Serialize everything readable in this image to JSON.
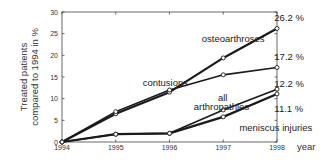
{
  "chart_data": {
    "type": "line",
    "title": "",
    "xlabel": "year",
    "ylabel": "Treated patients compared to 1994 in %",
    "ylabel_lines": [
      "Treated patients",
      "compared to 1994 in %"
    ],
    "x": [
      1994,
      1995,
      1996,
      1997,
      1998
    ],
    "xticks": [
      "1994",
      "1995",
      "1996",
      "1997",
      "1998"
    ],
    "yticks": [
      "0",
      "5",
      "10",
      "15",
      "20",
      "25",
      "30"
    ],
    "ylim": [
      0,
      30
    ],
    "grid": false,
    "legend": "inline labels",
    "series": [
      {
        "name": "osteoarthroses",
        "values": [
          0,
          6.5,
          11.5,
          19.4,
          26.2
        ],
        "end_label": "26.2 %",
        "stroke_width": 2.2
      },
      {
        "name": "contusions",
        "values": [
          0,
          7.0,
          12.0,
          15.5,
          17.2
        ],
        "end_label": "17.2 %",
        "stroke_width": 1.6
      },
      {
        "name": "all arthropathies",
        "values": [
          0,
          1.8,
          2.0,
          7.4,
          12.2
        ],
        "end_label": "12.2 %",
        "stroke_width": 1.6
      },
      {
        "name": "meniscus injuries",
        "values": [
          0,
          1.8,
          2.0,
          5.8,
          11.1
        ],
        "end_label": "11.1 %",
        "stroke_width": 2.2
      }
    ],
    "annotations": [
      {
        "text": "osteoarthroses",
        "x": 1996.6,
        "y": 23.0
      },
      {
        "text": "contusions",
        "x": 1995.5,
        "y": 13.0
      },
      {
        "text": "all",
        "x": 1996.9,
        "y": 9.5
      },
      {
        "text": "arthropathies",
        "x": 1996.45,
        "y": 7.4
      },
      {
        "text": "meniscus injuries",
        "x": 1997.3,
        "y": 2.5
      },
      {
        "text": "26.2 %",
        "x": 1997.95,
        "y": 28.0
      },
      {
        "text": "17.2 %",
        "x": 1997.95,
        "y": 19.0
      },
      {
        "text": "12.2 %",
        "x": 1997.95,
        "y": 12.8
      },
      {
        "text": "11.1 %",
        "x": 1997.95,
        "y": 7.0
      }
    ]
  }
}
